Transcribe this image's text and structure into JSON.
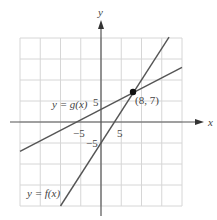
{
  "chart_data": {
    "type": "line",
    "title": "",
    "xlabel": "x",
    "ylabel": "y",
    "xlim": [
      -20,
      20
    ],
    "ylim": [
      -20,
      20
    ],
    "grid": true,
    "grid_step": 5,
    "x_ticks_labeled": [
      -5,
      5
    ],
    "y_ticks_labeled": [
      -5,
      5
    ],
    "tick_labels": {
      "x_neg": "−5",
      "x_pos": "5",
      "y_neg": "−5",
      "y_pos": "5"
    },
    "series": [
      {
        "name": "y = g(x)",
        "label": "y = g(x)",
        "equation": "g(x) = 0.5x + 3",
        "slope": 0.5,
        "intercept": 3,
        "x_range": [
          -20,
          20
        ]
      },
      {
        "name": "y = f(x)",
        "label": "y = f(x)",
        "equation": "f(x) = 1.5x − 5",
        "slope": 1.5,
        "intercept": -5,
        "x_range": [
          -10,
          16.8
        ]
      }
    ],
    "annotations": [
      {
        "type": "point",
        "x": 8,
        "y": 7,
        "label": "(8, 7)"
      }
    ],
    "legend": "inline labels"
  },
  "colors": {
    "grid": "#d6d6d6",
    "axes": "#555555",
    "lines": "#555555",
    "point": "#111111"
  }
}
